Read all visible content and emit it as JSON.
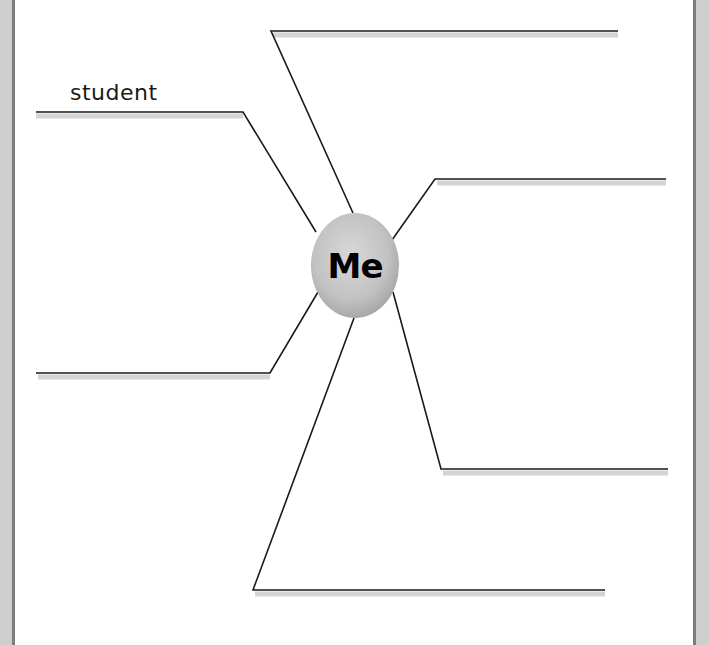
{
  "diagram": {
    "type": "concept-web",
    "center": {
      "label": "Me",
      "fill": "#c4c4c4"
    },
    "branches": [
      {
        "id": "top",
        "label": ""
      },
      {
        "id": "upper-left",
        "label": "student"
      },
      {
        "id": "upper-right",
        "label": ""
      },
      {
        "id": "lower-left",
        "label": ""
      },
      {
        "id": "lower-right",
        "label": ""
      },
      {
        "id": "bottom",
        "label": ""
      }
    ]
  },
  "colors": {
    "line": "#1a1a1a",
    "line_shadow": "#d4d4d4",
    "border_light": "#cfcfcf",
    "border_dark": "#7d7d7d"
  }
}
